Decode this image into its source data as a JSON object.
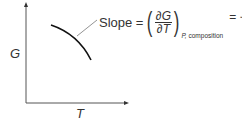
{
  "diagram": {
    "y_axis_label": "G",
    "x_axis_label": "T",
    "annotation": {
      "prefix": "Slope =",
      "numerator": "∂G",
      "denominator": "∂T",
      "subscript_var": "P,",
      "subscript_rest": " composition",
      "result": "= −S"
    },
    "curve": "Decreasing, concave-down curve of G vs T",
    "colors": {
      "axis": "#444444",
      "curve": "#111111",
      "leader": "#777777"
    }
  }
}
